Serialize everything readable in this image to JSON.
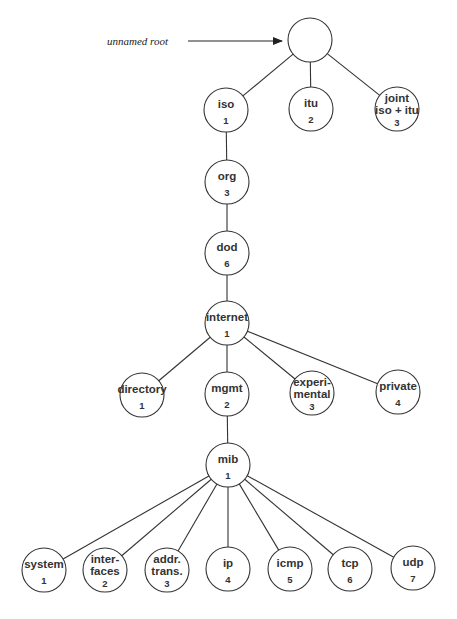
{
  "diagram": {
    "title": "",
    "annotation": {
      "text": "unnamed root"
    },
    "nodes": [
      {
        "id": "root",
        "lines": [],
        "number": "",
        "x": 310,
        "y": 40
      },
      {
        "id": "iso",
        "lines": [
          "iso"
        ],
        "number": "1",
        "x": 226,
        "y": 110
      },
      {
        "id": "itu",
        "lines": [
          "itu"
        ],
        "number": "2",
        "x": 311,
        "y": 109
      },
      {
        "id": "joint",
        "lines": [
          "joint",
          "iso + itu"
        ],
        "number": "3",
        "x": 397,
        "y": 109
      },
      {
        "id": "org",
        "lines": [
          "org"
        ],
        "number": "3",
        "x": 227,
        "y": 182
      },
      {
        "id": "dod",
        "lines": [
          "dod"
        ],
        "number": "6",
        "x": 227,
        "y": 253
      },
      {
        "id": "internet",
        "lines": [
          "internet"
        ],
        "number": "1",
        "x": 227,
        "y": 323
      },
      {
        "id": "directory",
        "lines": [
          "directory"
        ],
        "number": "1",
        "x": 142,
        "y": 395
      },
      {
        "id": "mgmt",
        "lines": [
          "mgmt"
        ],
        "number": "2",
        "x": 227,
        "y": 394
      },
      {
        "id": "experimental",
        "lines": [
          "experi-",
          "mental"
        ],
        "number": "3",
        "x": 312,
        "y": 393
      },
      {
        "id": "private",
        "lines": [
          "private"
        ],
        "number": "4",
        "x": 398,
        "y": 392
      },
      {
        "id": "mib",
        "lines": [
          "mib"
        ],
        "number": "1",
        "x": 228,
        "y": 465
      },
      {
        "id": "system",
        "lines": [
          "system"
        ],
        "number": "1",
        "x": 44,
        "y": 570
      },
      {
        "id": "interfaces",
        "lines": [
          "inter-",
          "faces"
        ],
        "number": "2",
        "x": 105,
        "y": 570
      },
      {
        "id": "addr-trans",
        "lines": [
          "addr.",
          "trans."
        ],
        "number": "3",
        "x": 167,
        "y": 570
      },
      {
        "id": "ip",
        "lines": [
          "ip"
        ],
        "number": "4",
        "x": 228,
        "y": 569
      },
      {
        "id": "icmp",
        "lines": [
          "icmp"
        ],
        "number": "5",
        "x": 290,
        "y": 569
      },
      {
        "id": "tcp",
        "lines": [
          "tcp"
        ],
        "number": "6",
        "x": 350,
        "y": 569
      },
      {
        "id": "udp",
        "lines": [
          "udp"
        ],
        "number": "7",
        "x": 413,
        "y": 568
      }
    ],
    "edges": [
      [
        "root",
        "iso"
      ],
      [
        "root",
        "itu"
      ],
      [
        "root",
        "joint"
      ],
      [
        "iso",
        "org"
      ],
      [
        "org",
        "dod"
      ],
      [
        "dod",
        "internet"
      ],
      [
        "internet",
        "directory"
      ],
      [
        "internet",
        "mgmt"
      ],
      [
        "internet",
        "experimental"
      ],
      [
        "internet",
        "private"
      ],
      [
        "mgmt",
        "mib"
      ],
      [
        "mib",
        "system"
      ],
      [
        "mib",
        "interfaces"
      ],
      [
        "mib",
        "addr-trans"
      ],
      [
        "mib",
        "ip"
      ],
      [
        "mib",
        "icmp"
      ],
      [
        "mib",
        "tcp"
      ],
      [
        "mib",
        "udp"
      ]
    ],
    "style": {
      "stroke": "#333333",
      "background": "#ffffff",
      "radius": 22
    }
  }
}
